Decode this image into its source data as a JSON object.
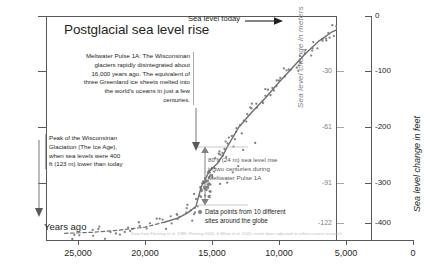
{
  "chart_data": {
    "type": "scatter",
    "title": "Postglacial sea level rise",
    "xlabel": "Years ago",
    "ylabel_left": "Sea level change in meters",
    "ylabel_right": "Sea level change in feet",
    "xlim": [
      26500,
      -800
    ],
    "ylim_feet": [
      -430,
      20
    ],
    "xticks": [
      "25,000",
      "20,000",
      "15,000",
      "10,000",
      "5,000",
      "0"
    ],
    "xtick_values": [
      25000,
      20000,
      15000,
      10000,
      5000,
      0
    ],
    "yticks_meters": [
      "-30",
      "-61",
      "-91",
      "-122"
    ],
    "ytick_values_meters": [
      -30,
      -61,
      -91,
      -122
    ],
    "yticks_feet": [
      "0",
      "-100",
      "-200",
      "-300",
      "-400"
    ],
    "ytick_values_feet": [
      0,
      -100,
      -200,
      -300,
      -400
    ],
    "grid": false,
    "legend_position": "bottom-right",
    "series": [
      {
        "name": "Sea level curve (modeled)",
        "style": "line",
        "x": [
          26000,
          24000,
          22000,
          20000,
          18500,
          17500,
          16800,
          16200,
          15800,
          15200,
          14600,
          14200,
          13800,
          13000,
          12000,
          11000,
          10000,
          9000,
          8000,
          7000,
          6000,
          5000,
          4000,
          3000,
          2000,
          1000,
          0
        ],
        "y_feet": [
          -420,
          -418,
          -414,
          -408,
          -398,
          -390,
          -380,
          -368,
          -330,
          -300,
          -285,
          -270,
          -250,
          -215,
          -185,
          -158,
          -128,
          -100,
          -72,
          -48,
          -30,
          -20,
          -13,
          -8,
          -5,
          -3,
          0
        ]
      },
      {
        "name": "Data points from 10 different sites around the globe",
        "style": "scatter",
        "x": [
          25400,
          24700,
          24100,
          23500,
          22800,
          22100,
          21500,
          20900,
          20300,
          19700,
          19100,
          18600,
          18200,
          17800,
          17400,
          17100,
          16800,
          16500,
          16300,
          16100,
          15950,
          15800,
          15700,
          15600,
          15500,
          15400,
          15350,
          15300,
          15250,
          15200,
          15100,
          15000,
          14800,
          14600,
          14400,
          14200,
          14000,
          13800,
          13600,
          13400,
          13200,
          13000,
          12700,
          12400,
          12100,
          11800,
          11500,
          11200,
          10900,
          10600,
          10300,
          10000,
          9700,
          9400,
          9100,
          8800,
          8500,
          8200,
          7900,
          7600,
          7300,
          7000,
          6700,
          6400,
          6100,
          5800,
          5500,
          5200,
          4900,
          4600,
          4300,
          4000,
          3700,
          3400,
          3100,
          2800,
          2500,
          2200,
          1900,
          1600,
          1300,
          1000,
          700,
          400,
          150
        ],
        "y_feet": [
          -422,
          -425,
          -419,
          -415,
          -421,
          -412,
          -409,
          -416,
          -405,
          -401,
          -398,
          -403,
          -393,
          -388,
          -392,
          -379,
          -372,
          -380,
          -362,
          -352,
          -344,
          -336,
          -340,
          -330,
          -322,
          -326,
          -318,
          -334,
          -312,
          -308,
          -300,
          -296,
          -288,
          -276,
          -268,
          -272,
          -256,
          -248,
          -238,
          -244,
          -226,
          -218,
          -205,
          -196,
          -186,
          -178,
          -168,
          -160,
          -150,
          -143,
          -134,
          -126,
          -118,
          -110,
          -104,
          -96,
          -88,
          -80,
          -74,
          -66,
          -58,
          -52,
          -45,
          -38,
          -32,
          -27,
          -22,
          -18,
          -15,
          -12,
          -10,
          -9,
          -7,
          -6,
          -5,
          -4,
          -4,
          -3,
          -3,
          -2,
          -2,
          -1,
          -1,
          0,
          0
        ]
      }
    ],
    "annotations": [
      {
        "id": "sea-level-today",
        "text": "Sea level today",
        "has_arrow": true
      },
      {
        "id": "meltwater-pulse-1a",
        "text": "Meltwater Pulse 1A: The Wisconsinan glaciers rapidly disintegrated about 16,000 years ago. The equivalent of three Greenland ice sheets melted into the world's oceans in just a few centuries."
      },
      {
        "id": "peak-wisconsinan",
        "text": "Peak of the Wisconsinan Glaciation (The Ice Age), when sea levels were 400 ft (123 m) lower than today"
      },
      {
        "id": "pulse-rise-measure",
        "text": "80 ft (24 m) sea level rise in two centuries during Meltwater Pulse 1A"
      }
    ],
    "legend": {
      "marker": "dot",
      "label": "Data points from 10 different sites around the globe"
    },
    "source": "Data from Fleming et al. 1998, Fleming 2000, & Milne et al. 2005; event dates adjusted to reflect current research",
    "colors": {
      "curve": "#6d6e71",
      "points": "#808285",
      "axis": "#58595b",
      "text": "#231f20",
      "muted": "#808285",
      "faint": "#bcbec0"
    }
  }
}
